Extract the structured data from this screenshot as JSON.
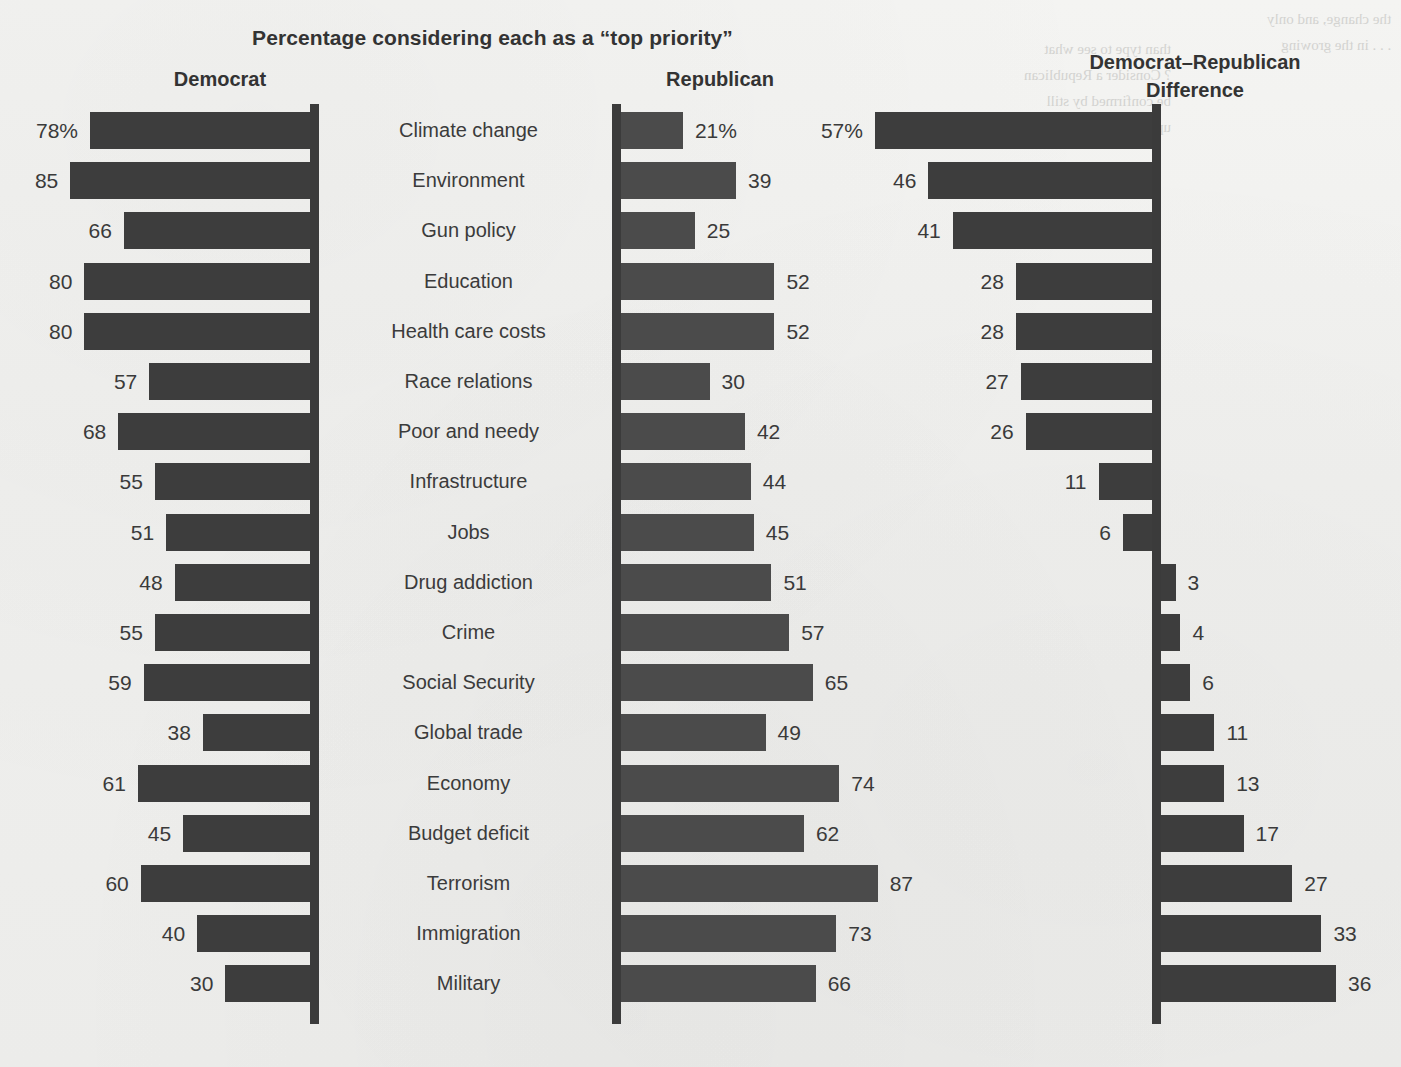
{
  "title": "Percentage considering each as a “top priority”",
  "headers": {
    "democrat": "Democrat",
    "republican": "Republican",
    "difference_line1": "Democrat–Republican",
    "difference_line2": "Difference"
  },
  "colors": {
    "background": "#f1f1ef",
    "bar": "#3d3d3d",
    "bar_republican": "#4b4b4b",
    "axis": "#3b3b3b",
    "text": "#333333"
  },
  "bleed_text": {
    "top_right": "the change, and only\n. . . in the growing",
    "body": "than type to see what\n? Consider a Republican\nbe confirmed by still\nup some of the other"
  },
  "chart_data": {
    "type": "bar",
    "title": "Percentage considering each as a “top priority”",
    "xlabel": "",
    "ylabel": "",
    "orientation": "horizontal",
    "panels": [
      {
        "name": "Democrat",
        "direction": "left",
        "xlim": [
          0,
          100
        ],
        "unit": "%"
      },
      {
        "name": "Republican",
        "direction": "right",
        "xlim": [
          0,
          100
        ],
        "unit": "%"
      },
      {
        "name": "Democrat–Republican Difference",
        "direction": "signed",
        "xlim": [
          -60,
          40
        ],
        "unit": "%"
      }
    ],
    "categories": [
      "Climate change",
      "Environment",
      "Gun policy",
      "Education",
      "Health care costs",
      "Race relations",
      "Poor and needy",
      "Infrastructure",
      "Jobs",
      "Drug addiction",
      "Crime",
      "Social Security",
      "Global trade",
      "Economy",
      "Budget deficit",
      "Terrorism",
      "Immigration",
      "Military"
    ],
    "series": [
      {
        "name": "Democrat",
        "values": [
          78,
          85,
          66,
          80,
          80,
          57,
          68,
          55,
          51,
          48,
          55,
          59,
          38,
          61,
          45,
          60,
          40,
          30
        ],
        "labels": [
          "78%",
          "85",
          "66",
          "80",
          "80",
          "57",
          "68",
          "55",
          "51",
          "48",
          "55",
          "59",
          "38",
          "61",
          "45",
          "60",
          "40",
          "30"
        ]
      },
      {
        "name": "Republican",
        "values": [
          21,
          39,
          25,
          52,
          52,
          30,
          42,
          44,
          45,
          51,
          57,
          65,
          49,
          74,
          62,
          87,
          73,
          66
        ],
        "labels": [
          "21%",
          "39",
          "25",
          "52",
          "52",
          "30",
          "42",
          "44",
          "45",
          "51",
          "57",
          "65",
          "49",
          "74",
          "62",
          "87",
          "73",
          "66"
        ]
      },
      {
        "name": "Democrat–Republican Difference",
        "values": [
          57,
          46,
          41,
          28,
          28,
          27,
          26,
          11,
          6,
          -3,
          -4,
          -6,
          -11,
          -13,
          -17,
          -27,
          -33,
          -36
        ],
        "labels": [
          "57%",
          "46",
          "41",
          "28",
          "28",
          "27",
          "26",
          "11",
          "6",
          "3",
          "4",
          "6",
          "11",
          "13",
          "17",
          "27",
          "33",
          "36"
        ]
      }
    ],
    "grid": false,
    "legend": "none"
  },
  "geometry": {
    "row_top_first": 112,
    "row_pitch": 50.2,
    "bar_height": 37,
    "axis_democrat_x": 310,
    "axis_republican_x": 612,
    "axis_difference_x": 1152,
    "px_per_unit_dem": 2.82,
    "px_per_unit_rep": 2.95,
    "px_per_unit_diff": 4.86
  }
}
